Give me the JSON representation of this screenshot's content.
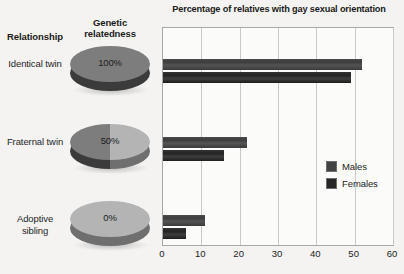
{
  "columns": {
    "relationship_header": "Relationship",
    "genetic_header": "Genetic relatedness"
  },
  "rows": [
    {
      "relationship": "Identical twin",
      "relatedness_label": "100%",
      "relatedness": 100
    },
    {
      "relationship": "Fraternal twin",
      "relatedness_label": "50%",
      "relatedness": 50
    },
    {
      "relationship": "Adoptive sibling",
      "relatedness_label": "0%",
      "relatedness": 0
    }
  ],
  "legend": {
    "items": [
      {
        "label": "Males",
        "color": "#434343"
      },
      {
        "label": "Females",
        "color": "#262626"
      }
    ]
  },
  "colors": {
    "pie_dark": "#7d7d7d",
    "pie_light": "#b4b4b4",
    "pie_side_dark": "#3b3b3b",
    "pie_side_light": "#6f6f6f",
    "males_bar": "#434343",
    "females_bar": "#262626",
    "plot_background": "#fbfbfa",
    "grid": "#c9c9c7",
    "page_background": "#f4f3f1"
  },
  "chart_data": {
    "type": "bar",
    "orientation": "horizontal",
    "title": "Percentage of relatives with gay sexual orientation",
    "xlabel": "",
    "ylabel": "",
    "categories": [
      "Identical twin",
      "Fraternal twin",
      "Adoptive sibling"
    ],
    "series": [
      {
        "name": "Males",
        "values": [
          52,
          22,
          11
        ]
      },
      {
        "name": "Females",
        "values": [
          49,
          16,
          6
        ]
      }
    ],
    "xlim": [
      0,
      60
    ],
    "xticks": [
      0,
      10,
      20,
      30,
      40,
      50,
      60
    ],
    "xtick_labels": [
      "0",
      "10",
      "20",
      "30",
      "40",
      "50",
      "60"
    ],
    "grid": "vertical",
    "legend_position": "right-middle"
  }
}
